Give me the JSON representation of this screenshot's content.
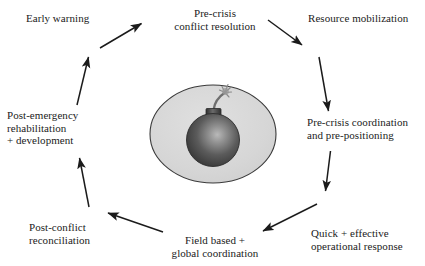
{
  "diagram": {
    "type": "cycle-diagram",
    "background_color": "#ffffff",
    "text_color": "#1b1b1b",
    "arrow_color": "#1b1b1b",
    "nodes": [
      {
        "id": "early-warning",
        "lines": [
          "Early warning"
        ],
        "position": "top-left"
      },
      {
        "id": "pre-crisis-conflict-resolution",
        "lines": [
          "Pre-crisis",
          "conflict resolution"
        ],
        "position": "top-center"
      },
      {
        "id": "resource-mobilization",
        "lines": [
          "Resource mobilization"
        ],
        "position": "top-right"
      },
      {
        "id": "pre-crisis-coordination",
        "lines": [
          "Pre-crisis coordination",
          "and pre-positioning"
        ],
        "position": "right"
      },
      {
        "id": "quick-effective-operational-response",
        "lines": [
          "Quick + effective",
          "operational response"
        ],
        "position": "bottom-right"
      },
      {
        "id": "field-based-global-coordination",
        "lines": [
          "Field based +",
          "global coordination"
        ],
        "position": "bottom-center"
      },
      {
        "id": "post-conflict-reconciliation",
        "lines": [
          "Post-conflict",
          "reconciliation"
        ],
        "position": "bottom-left"
      },
      {
        "id": "post-emergency-rehabilitation",
        "lines": [
          "Post-emergency",
          "rehabilitation",
          "+ development"
        ],
        "position": "left"
      }
    ],
    "arrows": [
      {
        "id": "arrow-early-warning-to-pre-crisis",
        "from": "early-warning",
        "to": "pre-crisis-conflict-resolution",
        "direction": "up-right"
      },
      {
        "id": "arrow-pre-crisis-to-resource",
        "from": "pre-crisis-conflict-resolution",
        "to": "resource-mobilization",
        "direction": "down-right"
      },
      {
        "id": "arrow-resource-to-coordination",
        "from": "resource-mobilization",
        "to": "pre-crisis-coordination",
        "direction": "down"
      },
      {
        "id": "arrow-coordination-to-quick",
        "from": "pre-crisis-coordination",
        "to": "quick-effective-operational-response",
        "direction": "down"
      },
      {
        "id": "arrow-quick-to-field-based",
        "from": "quick-effective-operational-response",
        "to": "field-based-global-coordination",
        "direction": "down-left"
      },
      {
        "id": "arrow-field-based-to-post-conflict",
        "from": "field-based-global-coordination",
        "to": "post-conflict-reconciliation",
        "direction": "up-left"
      },
      {
        "id": "arrow-post-conflict-to-post-emergency",
        "from": "post-conflict-reconciliation",
        "to": "post-emergency-rehabilitation",
        "direction": "up"
      },
      {
        "id": "arrow-post-emergency-to-early-warning",
        "from": "post-emergency-rehabilitation",
        "to": "early-warning",
        "direction": "up"
      }
    ],
    "center_emblem": {
      "id": "bomb-emblem",
      "description": "bomb inside a light grey ellipse",
      "ellipse_fill": "#d9d9d9",
      "ellipse_stroke": "#3a3a3a",
      "bomb_body_color": "#4a4a4a",
      "bomb_highlight_color": "#b5b5b5",
      "fuse_color": "#6b6b6b"
    }
  }
}
